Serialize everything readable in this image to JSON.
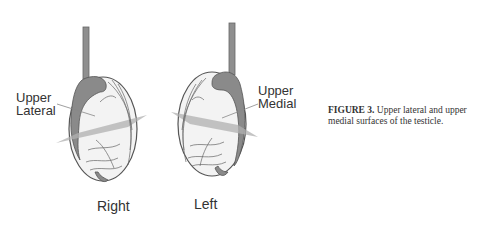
{
  "figure": {
    "labels": {
      "right_surface": [
        "Upper",
        "Lateral"
      ],
      "left_surface": [
        "Upper",
        "Medial"
      ],
      "right_side": "Right",
      "left_side": "Left"
    },
    "caption": {
      "number": "FIGURE 3.",
      "text": " Upper lateral and upper medial surfaces of the testicle."
    },
    "colors": {
      "outline": "#555555",
      "epididymis": "#8a8a8a",
      "plane": "#b5b5b5",
      "body": "#f2f2f2"
    }
  }
}
